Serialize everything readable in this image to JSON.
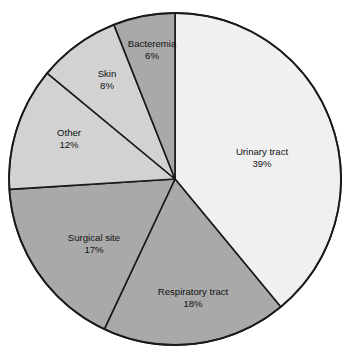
{
  "chart_data": {
    "type": "pie",
    "title": "",
    "subtitle": "",
    "xlabel": "",
    "ylabel": "",
    "legend_position": "none",
    "grid": false,
    "start_angle_deg": 0,
    "direction": "clockwise",
    "units": "percent",
    "total": 100,
    "categories": [
      "Urinary tract",
      "Respiratory tract",
      "Surgical site",
      "Other",
      "Skin",
      "Bacteremia"
    ],
    "values": [
      39,
      18,
      17,
      12,
      8,
      6
    ],
    "value_labels": [
      "39%",
      "18%",
      "17%",
      "12%",
      "8%",
      "6%"
    ],
    "colors": [
      "#f0f0f0",
      "#a9a9a9",
      "#a9a9a9",
      "#d2d2d2",
      "#d2d2d2",
      "#a9a9a9"
    ],
    "slices": [
      {
        "label": "Urinary tract",
        "value": 39,
        "value_label": "39%",
        "color": "#f0f0f0",
        "start_deg": 0,
        "end_deg": 140.4,
        "label_x": 262,
        "label_y": 152,
        "value_x": 262,
        "value_y": 164
      },
      {
        "label": "Respiratory tract",
        "value": 18,
        "value_label": "18%",
        "color": "#a9a9a9",
        "start_deg": 140.4,
        "end_deg": 205.2,
        "label_x": 193,
        "label_y": 292,
        "value_x": 193,
        "value_y": 304
      },
      {
        "label": "Surgical site",
        "value": 17,
        "value_label": "17%",
        "color": "#a9a9a9",
        "start_deg": 205.2,
        "end_deg": 266.4,
        "label_x": 94,
        "label_y": 238,
        "value_x": 94,
        "value_y": 250
      },
      {
        "label": "Other",
        "value": 12,
        "value_label": "12%",
        "color": "#d2d2d2",
        "start_deg": 266.4,
        "end_deg": 309.6,
        "label_x": 69,
        "label_y": 133,
        "value_x": 69,
        "value_y": 145
      },
      {
        "label": "Skin",
        "value": 8,
        "value_label": "8%",
        "color": "#d2d2d2",
        "start_deg": 309.6,
        "end_deg": 338.4,
        "label_x": 107,
        "label_y": 74,
        "value_x": 107,
        "value_y": 86
      },
      {
        "label": "Bacteremia",
        "value": 6,
        "value_label": "6%",
        "color": "#a9a9a9",
        "start_deg": 338.4,
        "end_deg": 360,
        "label_x": 152,
        "label_y": 44,
        "value_x": 152,
        "value_y": 56
      }
    ],
    "geometry": {
      "center_x": 175,
      "center_y": 179,
      "radius": 166
    }
  }
}
